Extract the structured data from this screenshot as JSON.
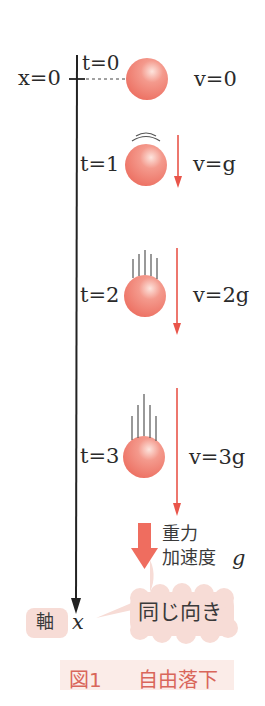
{
  "figure": {
    "caption_number": "図1",
    "caption_title": "自由落下"
  },
  "axis": {
    "origin_label": "x=0",
    "axis_word": "軸",
    "axis_var": "x"
  },
  "states": [
    {
      "t_label": "t=0",
      "v_label": "v=0"
    },
    {
      "t_label": "t=1",
      "v_label": "v=g"
    },
    {
      "t_label": "t=2",
      "v_label": "v=2g"
    },
    {
      "t_label": "t=3",
      "v_label": "v=3g"
    }
  ],
  "gravity": {
    "line1": "重力",
    "line2": "加速度",
    "symbol": "g"
  },
  "bubble": {
    "text": "同じ向き"
  },
  "colors": {
    "ball": "#ef7a6c",
    "arrow": "#e9554a",
    "bubble": "#f7dcd6",
    "caption_bg": "#fbece8",
    "caption_text": "#d9665a",
    "axis": "#222222"
  }
}
